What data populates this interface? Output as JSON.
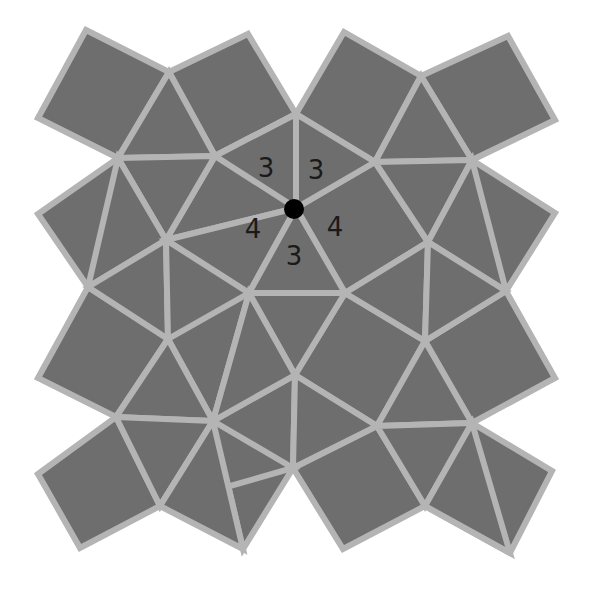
{
  "diagram": {
    "type": "snub square tiling",
    "vertex_configuration": "3.3.4.3.4",
    "colors": {
      "background": "#ffffff",
      "tile_fill": "#6e6e6e",
      "tile_edge": "#b4b4b4",
      "label_text": "#1a1a1a",
      "vertex_marker": "#000000"
    },
    "marked_vertex": {
      "x": 294,
      "y": 209,
      "r": 10
    },
    "labels": [
      {
        "text": "3",
        "x": 266,
        "y": 168
      },
      {
        "text": "3",
        "x": 316,
        "y": 170
      },
      {
        "text": "4",
        "x": 253,
        "y": 229
      },
      {
        "text": "4",
        "x": 335,
        "y": 227
      },
      {
        "text": "3",
        "x": 294,
        "y": 256
      }
    ],
    "squares": [
      [
        [
          86,
          30
        ],
        [
          169,
          72
        ],
        [
          118,
          158
        ],
        [
          38,
          118
        ]
      ],
      [
        [
          169,
          72
        ],
        [
          248,
          34
        ],
        [
          296,
          114
        ],
        [
          215,
          156
        ]
      ],
      [
        [
          344,
          32
        ],
        [
          296,
          114
        ],
        [
          375,
          162
        ],
        [
          421,
          76
        ]
      ],
      [
        [
          421,
          76
        ],
        [
          508,
          36
        ],
        [
          555,
          120
        ],
        [
          472,
          160
        ]
      ],
      [
        [
          38,
          214
        ],
        [
          118,
          158
        ],
        [
          166,
          240
        ],
        [
          88,
          287
        ]
      ],
      [
        [
          215,
          156
        ],
        [
          296,
          114
        ],
        [
          296,
          208
        ],
        [
          166,
          240
        ]
      ],
      [
        [
          296,
          208
        ],
        [
          375,
          162
        ],
        [
          428,
          242
        ],
        [
          345,
          293
        ]
      ],
      [
        [
          472,
          160
        ],
        [
          555,
          213
        ],
        [
          506,
          291
        ],
        [
          428,
          242
        ]
      ],
      [
        [
          38,
          378
        ],
        [
          88,
          287
        ],
        [
          168,
          339
        ],
        [
          116,
          417
        ]
      ],
      [
        [
          166,
          240
        ],
        [
          249,
          293
        ],
        [
          213,
          421
        ],
        [
          168,
          339
        ]
      ],
      [
        [
          345,
          293
        ],
        [
          425,
          341
        ],
        [
          377,
          426
        ],
        [
          295,
          375
        ]
      ],
      [
        [
          506,
          291
        ],
        [
          555,
          378
        ],
        [
          472,
          423
        ],
        [
          425,
          341
        ]
      ],
      [
        [
          38,
          474
        ],
        [
          116,
          417
        ],
        [
          160,
          506
        ],
        [
          80,
          548
        ]
      ],
      [
        [
          213,
          421
        ],
        [
          295,
          375
        ],
        [
          293,
          468
        ],
        [
          243,
          549
        ]
      ],
      [
        [
          293,
          468
        ],
        [
          377,
          426
        ],
        [
          425,
          506
        ],
        [
          343,
          549
        ]
      ],
      [
        [
          472,
          423
        ],
        [
          552,
          471
        ],
        [
          510,
          553
        ],
        [
          425,
          506
        ]
      ]
    ],
    "triangles": [
      [
        [
          169,
          72
        ],
        [
          215,
          156
        ],
        [
          118,
          158
        ]
      ],
      [
        [
          118,
          158
        ],
        [
          215,
          156
        ],
        [
          166,
          240
        ]
      ],
      [
        [
          215,
          156
        ],
        [
          296,
          114
        ],
        [
          296,
          208
        ]
      ],
      [
        [
          296,
          114
        ],
        [
          375,
          162
        ],
        [
          296,
          208
        ]
      ],
      [
        [
          375,
          162
        ],
        [
          421,
          76
        ],
        [
          472,
          160
        ]
      ],
      [
        [
          375,
          162
        ],
        [
          472,
          160
        ],
        [
          428,
          242
        ]
      ],
      [
        [
          118,
          158
        ],
        [
          166,
          240
        ],
        [
          88,
          287
        ]
      ],
      [
        [
          166,
          240
        ],
        [
          296,
          208
        ],
        [
          249,
          293
        ]
      ],
      [
        [
          296,
          208
        ],
        [
          345,
          293
        ],
        [
          249,
          293
        ]
      ],
      [
        [
          428,
          242
        ],
        [
          506,
          291
        ],
        [
          472,
          160
        ]
      ],
      [
        [
          88,
          287
        ],
        [
          166,
          240
        ],
        [
          168,
          339
        ]
      ],
      [
        [
          166,
          240
        ],
        [
          249,
          293
        ],
        [
          168,
          339
        ]
      ],
      [
        [
          249,
          293
        ],
        [
          345,
          293
        ],
        [
          295,
          375
        ]
      ],
      [
        [
          249,
          293
        ],
        [
          295,
          375
        ],
        [
          213,
          421
        ]
      ],
      [
        [
          345,
          293
        ],
        [
          428,
          242
        ],
        [
          425,
          341
        ]
      ],
      [
        [
          428,
          242
        ],
        [
          506,
          291
        ],
        [
          425,
          341
        ]
      ],
      [
        [
          116,
          417
        ],
        [
          168,
          339
        ],
        [
          213,
          421
        ]
      ],
      [
        [
          116,
          417
        ],
        [
          213,
          421
        ],
        [
          160,
          506
        ]
      ],
      [
        [
          213,
          421
        ],
        [
          293,
          468
        ],
        [
          160,
          506
        ]
      ],
      [
        [
          295,
          375
        ],
        [
          377,
          426
        ],
        [
          293,
          468
        ]
      ],
      [
        [
          377,
          426
        ],
        [
          472,
          423
        ],
        [
          425,
          341
        ]
      ],
      [
        [
          377,
          426
        ],
        [
          472,
          423
        ],
        [
          425,
          506
        ]
      ],
      [
        [
          160,
          506
        ],
        [
          243,
          549
        ],
        [
          213,
          421
        ]
      ],
      [
        [
          425,
          506
        ],
        [
          510,
          553
        ],
        [
          472,
          423
        ]
      ]
    ]
  }
}
